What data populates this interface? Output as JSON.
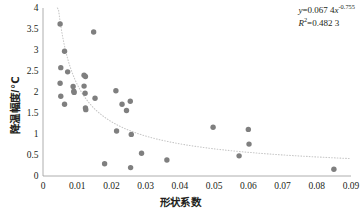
{
  "chart_data": {
    "type": "scatter",
    "title": "",
    "xlabel": "形状系数",
    "ylabel": "降温幅度/℃",
    "xlim": [
      0,
      0.09
    ],
    "ylim": [
      0,
      4
    ],
    "xticks": [
      "0",
      "0.01",
      "0.02",
      "0.03",
      "0.04",
      "0.05",
      "0.06",
      "0.07",
      "0.08",
      "0.09"
    ],
    "xtick_values": [
      0,
      0.01,
      0.02,
      0.03,
      0.04,
      0.05,
      0.06,
      0.07,
      0.08,
      0.09
    ],
    "yticks": [
      "0",
      "0.5",
      "1",
      "1.5",
      "2",
      "2.5",
      "3",
      "3.5",
      "4"
    ],
    "ytick_values": [
      0,
      0.5,
      1,
      1.5,
      2,
      2.5,
      3,
      3.5,
      4
    ],
    "grid": false,
    "legend": false,
    "marker_color": "#7f7f7f",
    "trendline_color": "#c8c8c8",
    "axis_color": "#9a9a9a",
    "points": [
      [
        0.005,
        3.62
      ],
      [
        0.0063,
        2.97
      ],
      [
        0.0052,
        2.58
      ],
      [
        0.005,
        2.21
      ],
      [
        0.0052,
        1.9
      ],
      [
        0.0063,
        1.71
      ],
      [
        0.0072,
        2.48
      ],
      [
        0.0088,
        2.13
      ],
      [
        0.009,
        2.02
      ],
      [
        0.0091,
        1.99
      ],
      [
        0.012,
        2.4
      ],
      [
        0.0124,
        2.37
      ],
      [
        0.012,
        2.14
      ],
      [
        0.0123,
        1.97
      ],
      [
        0.0124,
        1.62
      ],
      [
        0.0125,
        1.58
      ],
      [
        0.0148,
        3.43
      ],
      [
        0.0152,
        1.85
      ],
      [
        0.018,
        0.29
      ],
      [
        0.0213,
        2.03
      ],
      [
        0.0215,
        1.07
      ],
      [
        0.0231,
        1.71
      ],
      [
        0.0244,
        1.56
      ],
      [
        0.0255,
        1.78
      ],
      [
        0.0258,
        0.99
      ],
      [
        0.0256,
        0.2
      ],
      [
        0.0288,
        0.54
      ],
      [
        0.0362,
        0.38
      ],
      [
        0.0497,
        1.16
      ],
      [
        0.0573,
        0.48
      ],
      [
        0.06,
        1.11
      ],
      [
        0.0602,
        0.76
      ],
      [
        0.085,
        0.16
      ]
    ],
    "trendline": {
      "kind": "power",
      "coefficient": 0.0674,
      "exponent": -0.755,
      "equation_text": "y=0.067 4x",
      "equation_exponent": "-0.755",
      "r_squared_label": "R",
      "r_squared_sup": "2",
      "r_squared_value": "=0.482 3"
    }
  },
  "annotations": {
    "equation_y": "y",
    "equation_body": "=0.067 4",
    "equation_x": "x",
    "equation_power": "-0.755",
    "r2_r": "R",
    "r2_sup": "2",
    "r2_rest": "=0.482 3"
  }
}
